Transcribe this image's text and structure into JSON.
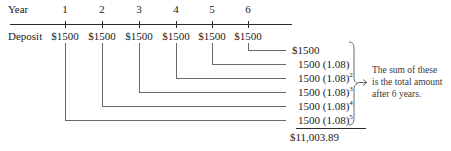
{
  "labels": {
    "year_row": "Year",
    "deposit_row": "Deposit"
  },
  "timeline": {
    "years": [
      "1",
      "2",
      "3",
      "4",
      "5",
      "6"
    ],
    "deposits": [
      "$1500",
      "$1500",
      "$1500",
      "$1500",
      "$1500",
      "$1500"
    ]
  },
  "accumulation": {
    "terms": [
      {
        "base": "$1500",
        "exp": ""
      },
      {
        "base": "1500 (1.08)",
        "exp": ""
      },
      {
        "base": "1500 (1.08)",
        "exp": "2"
      },
      {
        "base": "1500 (1.08)",
        "exp": "3"
      },
      {
        "base": "1500 (1.08)",
        "exp": "4"
      },
      {
        "base": "1500 (1.08)",
        "exp": "5"
      }
    ],
    "total": "$11,003.89"
  },
  "annotation": {
    "line1": "The sum of these",
    "line2": "is the total amount",
    "line3": "after 6 years."
  },
  "colors": {
    "ink": "#2b2b2b",
    "leader": "#6a6a6a",
    "note": "#3a3a3a"
  }
}
